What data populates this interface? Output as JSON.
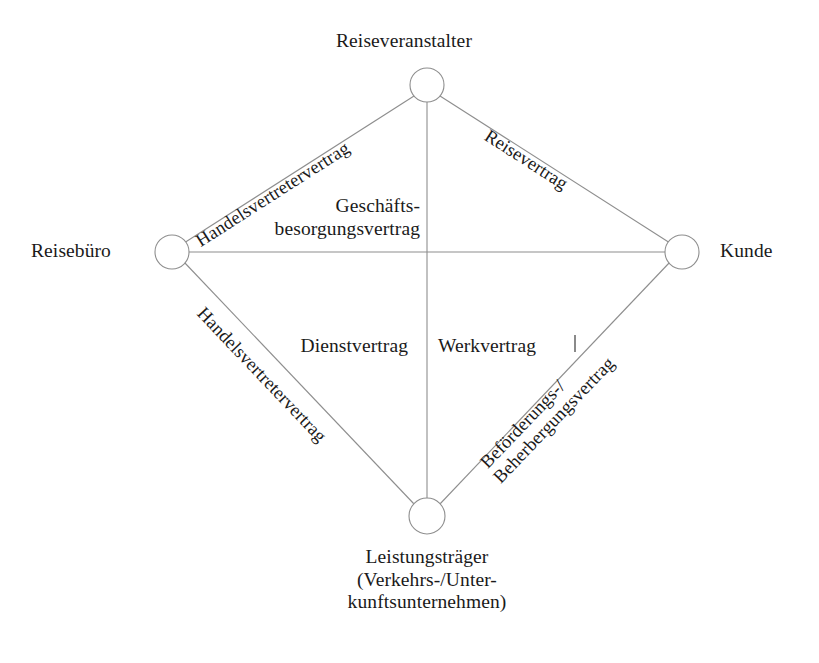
{
  "diagram": {
    "background_color": "#ffffff",
    "line_color": "#8e8e8e",
    "text_color": "#1a1a1a",
    "type": "relationship-diamond",
    "nodes": [
      {
        "id": "reiseveranstalter",
        "label": "Reiseveranstalter",
        "position": "top",
        "cx": 427,
        "cy": 85,
        "r": 17
      },
      {
        "id": "reisebuero",
        "label": "Reisebüro",
        "position": "left",
        "cx": 172,
        "cy": 252,
        "r": 17
      },
      {
        "id": "kunde",
        "label": "Kunde",
        "position": "right",
        "cx": 682,
        "cy": 252,
        "r": 17
      },
      {
        "id": "leistungstraeger",
        "label": "Leistungsträger",
        "position": "bottom",
        "cx": 427,
        "cy": 516,
        "r": 18,
        "sub_lines": [
          "(Verkehrs-/Unter-",
          "kunftsunternehmen)"
        ]
      }
    ],
    "edges": [
      {
        "id": "edge-veranstalter-buero",
        "from": "reiseveranstalter",
        "to": "reisebuero",
        "label": "Handelsvertretervertrag"
      },
      {
        "id": "edge-veranstalter-kunde",
        "from": "reiseveranstalter",
        "to": "kunde",
        "label": "Reisevertrag"
      },
      {
        "id": "edge-buero-leistungstraeger",
        "from": "reisebuero",
        "to": "leistungstraeger",
        "label": "Handelsvertretervertrag"
      },
      {
        "id": "edge-kunde-leistungstraeger",
        "from": "kunde",
        "to": "leistungstraeger",
        "label_line_1": "Beförderungs-/",
        "label_line_2": "Beherbergungsvertrag"
      },
      {
        "id": "edge-buero-kunde",
        "from": "reisebuero",
        "to": "kunde",
        "label": ""
      },
      {
        "id": "edge-veranstalter-leistungstraeger",
        "from": "reiseveranstalter",
        "to": "leistungstraeger",
        "label": ""
      }
    ],
    "inner_labels": [
      {
        "id": "geschaeftsbesorgungsvertrag",
        "line_1": "Geschäfts-",
        "line_2": "besorgungsvertrag"
      },
      {
        "id": "dienstvertrag",
        "text": "Dienstvertrag"
      },
      {
        "id": "werkvertrag",
        "text": "Werkvertrag"
      }
    ]
  }
}
